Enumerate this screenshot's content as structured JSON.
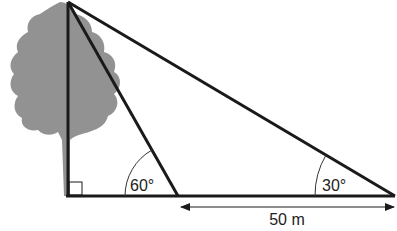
{
  "diagram": {
    "labels": {
      "angle_near": "60°",
      "angle_far": "30°",
      "distance": "50 m"
    },
    "colors": {
      "tree": "#8a8a8a",
      "line": "#1a1a1a"
    }
  }
}
